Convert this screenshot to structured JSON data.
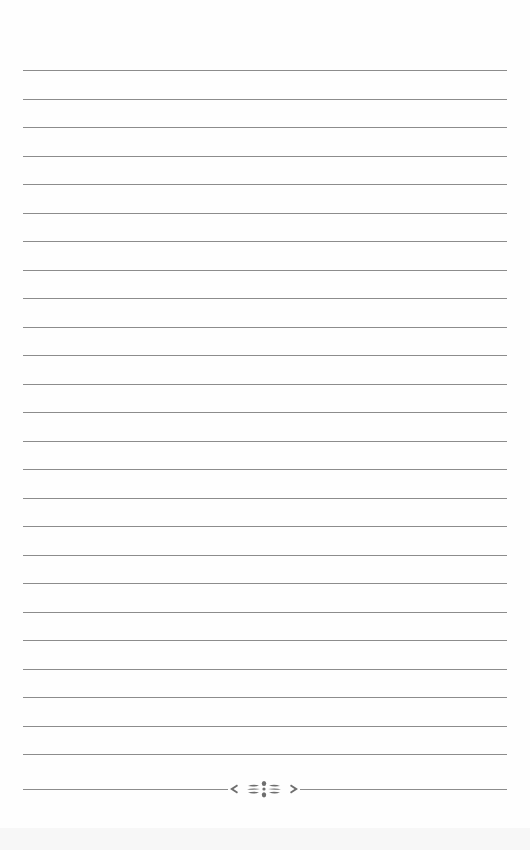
{
  "page": {
    "type": "lined-notebook-page",
    "background_color": "#fefefe",
    "line_color": "#8c8c8c",
    "line_count": 25,
    "first_line_y": 70,
    "line_spacing": 28.5,
    "line_left": 23,
    "line_width": 484
  },
  "footer": {
    "ornament_icon": "floral-flourish-icon",
    "ornament_color": "#6e6e6e",
    "rule_y": 789
  }
}
